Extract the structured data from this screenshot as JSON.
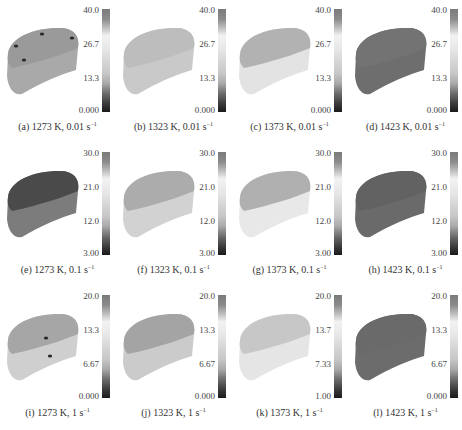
{
  "figure": {
    "panels": [
      {
        "id": "a",
        "label": "(a) 1273 K, 0.01 s",
        "sup": "−1",
        "ticks": [
          "40.0",
          "26.7",
          "13.3",
          "0.000"
        ],
        "fill": "#a9a9a9",
        "top_fill": "#9a9a9a",
        "spots": true
      },
      {
        "id": "b",
        "label": "(b) 1323 K, 0.01 s",
        "sup": "−1",
        "ticks": [
          "40.0",
          "26.7",
          "13.3",
          "0.000"
        ],
        "fill": "#c9c9c9",
        "top_fill": "#bdbdbd",
        "spots": false
      },
      {
        "id": "c",
        "label": "(c) 1373 K, 0.01 s",
        "sup": "−1",
        "ticks": [
          "40.0",
          "26.7",
          "13.3",
          "0.000"
        ],
        "fill": "#e3e3e3",
        "top_fill": "#b2b2b2",
        "spots": false
      },
      {
        "id": "d",
        "label": "(d) 1423 K, 0.01 s",
        "sup": "−1",
        "ticks": [
          "40.0",
          "26.7",
          "13.3",
          "0.000"
        ],
        "fill": "#6e6e6e",
        "top_fill": "#737373",
        "spots": false
      },
      {
        "id": "e",
        "label": "(e) 1273 K, 0.1 s",
        "sup": "−1",
        "ticks": [
          "30.0",
          "21.0",
          "12.0",
          "3.00"
        ],
        "fill": "#7c7c7c",
        "top_fill": "#4a4a4a",
        "spots": false
      },
      {
        "id": "f",
        "label": "(f) 1323 K, 0.1 s",
        "sup": "−1",
        "ticks": [
          "30.0",
          "21.0",
          "12.0",
          "3.00"
        ],
        "fill": "#d2d2d2",
        "top_fill": "#acacac",
        "spots": false
      },
      {
        "id": "g",
        "label": "(g) 1373 K, 0.1 s",
        "sup": "−1",
        "ticks": [
          "30.0",
          "21.0",
          "12.0",
          "3.00"
        ],
        "fill": "#e8e8e8",
        "top_fill": "#b0b0b0",
        "spots": false
      },
      {
        "id": "h",
        "label": "(h) 1423 K, 0.1 s",
        "sup": "−1",
        "ticks": [
          "30.0",
          "21.0",
          "12.0",
          "3.00"
        ],
        "fill": "#6a6a6a",
        "top_fill": "#626262",
        "spots": false
      },
      {
        "id": "i",
        "label": "(i) 1273 K, 1 s",
        "sup": "−1",
        "ticks": [
          "20.0",
          "13.3",
          "6.67",
          "0.000"
        ],
        "fill": "#cfcfcf",
        "top_fill": "#a6a6a6",
        "spots": true
      },
      {
        "id": "j",
        "label": "(j) 1323 K, 1 s",
        "sup": "−1",
        "ticks": [
          "20.0",
          "13.3",
          "6.67",
          "0.000"
        ],
        "fill": "#cbcbcb",
        "top_fill": "#a4a4a4",
        "spots": false
      },
      {
        "id": "k",
        "label": "(k) 1373 K, 1 s",
        "sup": "−1",
        "ticks": [
          "20.0",
          "13.7",
          "7.33",
          "1.00"
        ],
        "fill": "#e5e5e5",
        "top_fill": "#c7c7c7",
        "spots": false
      },
      {
        "id": "l",
        "label": "(l) 1423 K, 1 s",
        "sup": "−1",
        "ticks": [
          "20.0",
          "13.3",
          "6.67",
          "0.000"
        ],
        "fill": "#6c6c6c",
        "top_fill": "#6a6a6a",
        "spots": false
      }
    ]
  }
}
